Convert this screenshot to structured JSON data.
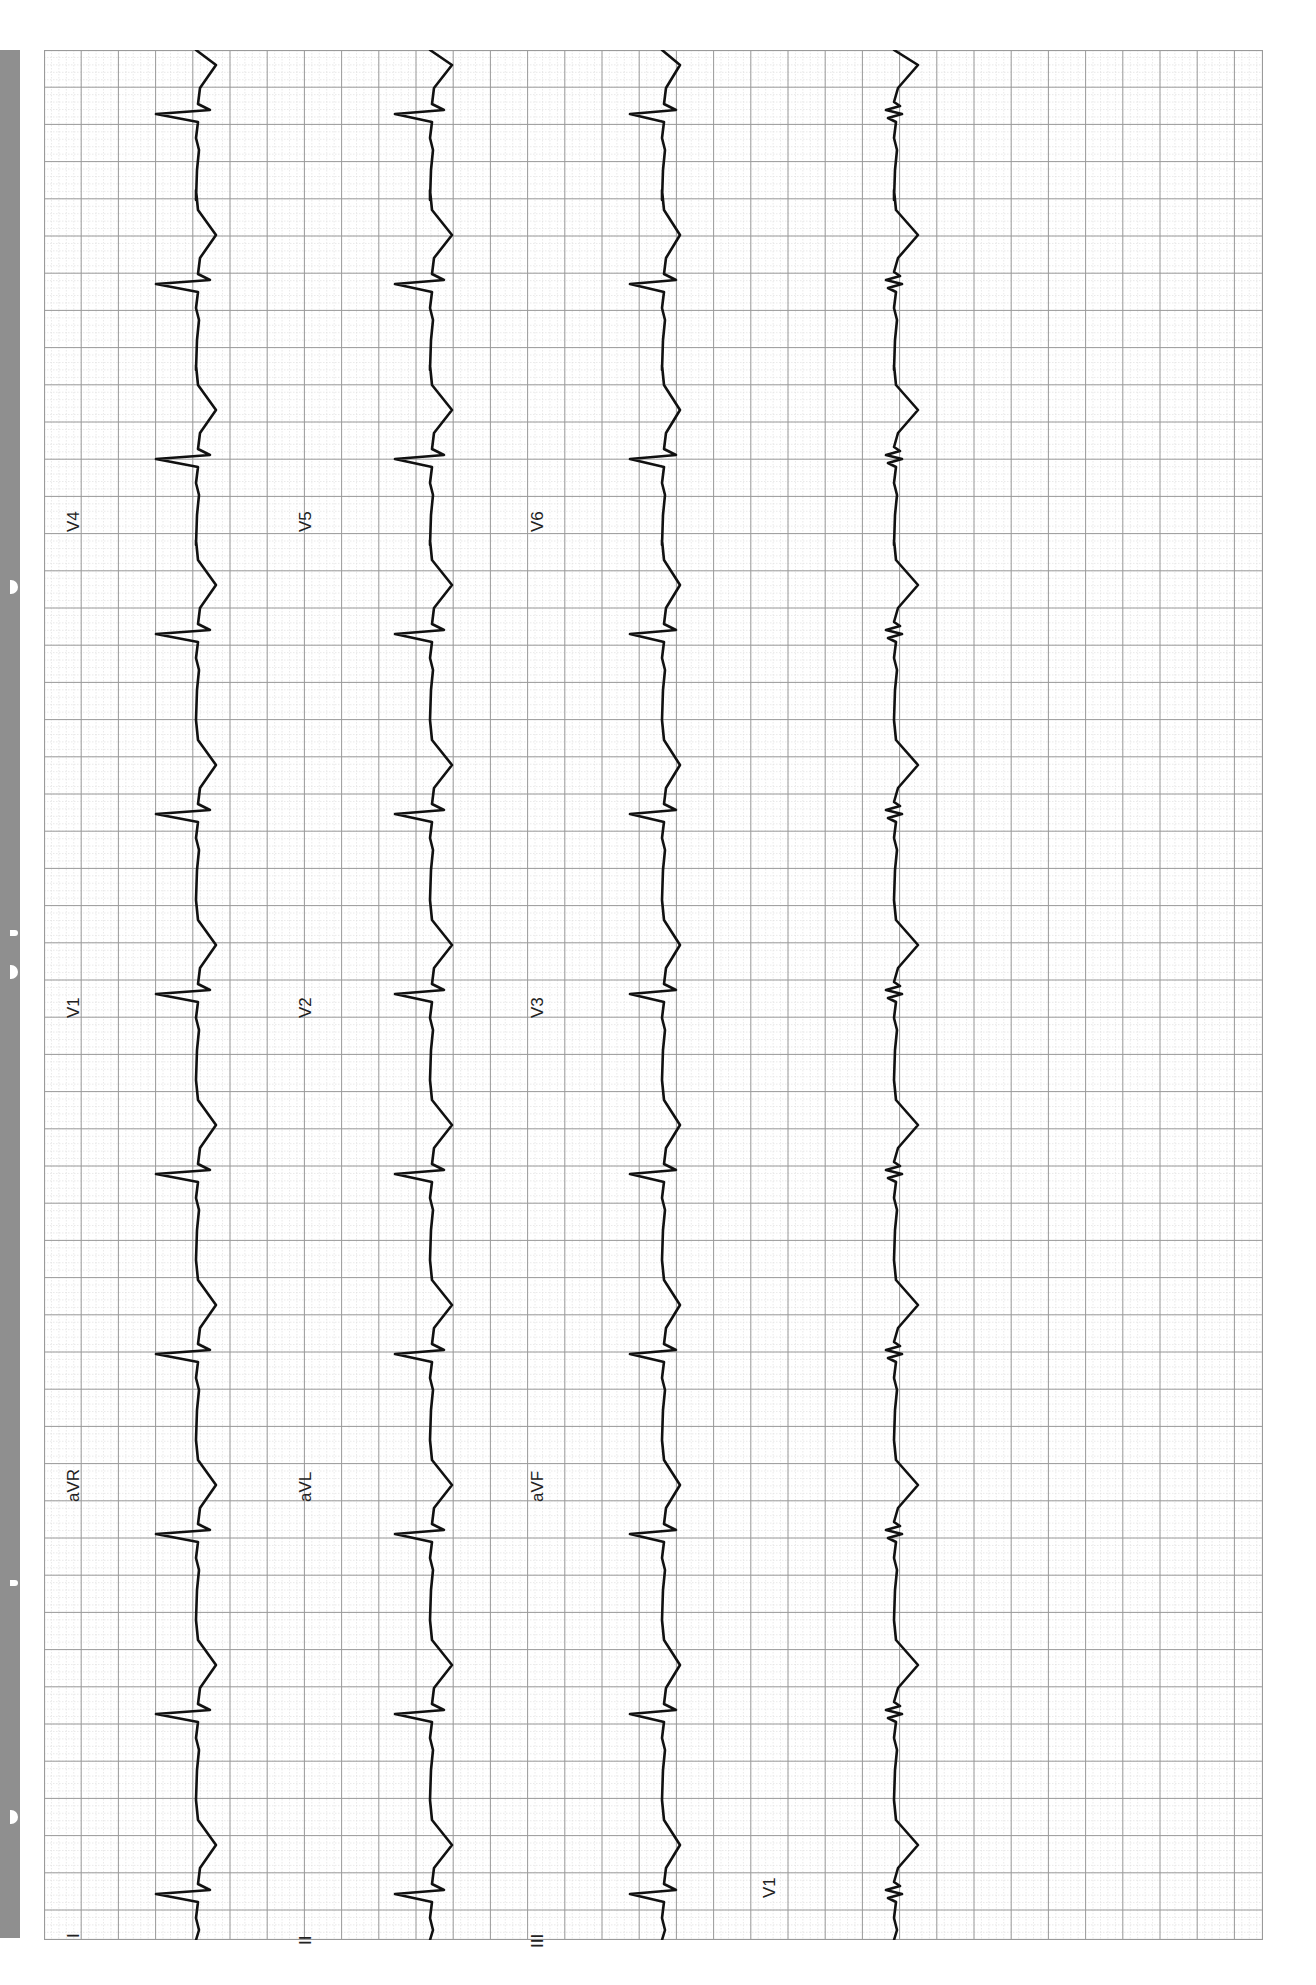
{
  "page": {
    "type": "12-lead ECG printout (rotated 90°, portrait scan)",
    "side_strip_color": "#8f8f8f",
    "grid": {
      "minor_color": "#dcdcdc",
      "major_color": "#9a9a9a",
      "trace_color": "#111111",
      "background": "#ffffff"
    }
  },
  "chart_data": {
    "type": "line",
    "title": "",
    "layout": "4 rows x 4 columns, rotated 90° counter-clockwise; time axis runs bottom-to-top",
    "grid": true,
    "rows": [
      {
        "row": 1,
        "leads": [
          "I",
          "aVR",
          "V1",
          "V4"
        ]
      },
      {
        "row": 2,
        "leads": [
          "II",
          "aVL",
          "V2",
          "V5"
        ]
      },
      {
        "row": 3,
        "leads": [
          "III",
          "aVF",
          "V3",
          "V6"
        ]
      },
      {
        "row": 4,
        "leads": [
          "V1"
        ],
        "note": "rhythm strip"
      }
    ],
    "labels": {
      "row1": [
        "I",
        "aVR",
        "V1",
        "V4"
      ],
      "row2": [
        "II",
        "aVL",
        "V2",
        "V5"
      ],
      "row3": [
        "III",
        "aVF",
        "V3",
        "V6"
      ],
      "row4": [
        "V1"
      ]
    },
    "beats_visible": 13,
    "rhythm": "regular, narrow-complex",
    "approx_rr_major_boxes": 4
  },
  "labels": {
    "r1": [
      "I",
      "aVR",
      "V1",
      "V4"
    ],
    "r2": [
      "II",
      "aVL",
      "V2",
      "V5"
    ],
    "r3": [
      "III",
      "aVF",
      "V3",
      "V6"
    ],
    "r4": [
      "V1"
    ]
  }
}
